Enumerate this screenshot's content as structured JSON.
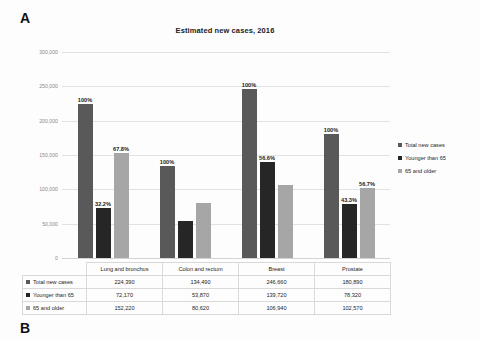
{
  "panels": {
    "a_label": "A",
    "b_label": "B"
  },
  "chart_data": {
    "type": "bar",
    "title": "Estimated new cases, 2016",
    "xlabel": "",
    "ylabel": "",
    "ylim": [
      0,
      300000
    ],
    "ytick_labels": [
      "300,000",
      "250,000",
      "200,000",
      "150,000",
      "100,000",
      "50,000",
      "0"
    ],
    "ytick_values": [
      300000,
      250000,
      200000,
      150000,
      100000,
      50000,
      0
    ],
    "grid": true,
    "legend_position": "right",
    "categories": [
      "Lung and bronchus",
      "Colon and rectum",
      "Breast",
      "Prostate"
    ],
    "series": [
      {
        "name": "Total new cases",
        "color": "#595959",
        "values": [
          224390,
          134490,
          246660,
          180890
        ],
        "display_values": [
          "224,390",
          "134,490",
          "246,660",
          "180,890"
        ],
        "point_labels": [
          "100%",
          "100%",
          "100%",
          "100%"
        ]
      },
      {
        "name": "Younger than 65",
        "color": "#262626",
        "values": [
          72170,
          53870,
          139720,
          78320
        ],
        "display_values": [
          "72,170",
          "53,870",
          "139,720",
          "78,320"
        ],
        "point_labels": [
          "32.2%",
          "",
          "56.6%",
          "43.3%"
        ]
      },
      {
        "name": "65 and older",
        "color": "#a6a6a6",
        "values": [
          152220,
          80620,
          106940,
          102570
        ],
        "display_values": [
          "152,220",
          "80,620",
          "106,940",
          "102,570"
        ],
        "point_labels": [
          "67.8%",
          "",
          "",
          "56.7%"
        ]
      }
    ]
  },
  "table": {
    "corner": "",
    "column_headers": [
      "Lung and bronchus",
      "Colon and rectum",
      "Breast",
      "Prostate"
    ],
    "rows": [
      {
        "label": "Total new cases",
        "color": "#595959",
        "cells": [
          "224,390",
          "134,490",
          "246,660",
          "180,890"
        ]
      },
      {
        "label": "Younger than 65",
        "color": "#262626",
        "cells": [
          "72,170",
          "53,870",
          "139,720",
          "78,320"
        ]
      },
      {
        "label": "65 and older",
        "color": "#a6a6a6",
        "cells": [
          "152,220",
          "80,620",
          "106,940",
          "102,570"
        ]
      }
    ]
  },
  "legend": {
    "items": [
      {
        "label": "Total new cases",
        "color": "#595959"
      },
      {
        "label": "Younger than 65",
        "color": "#262626"
      },
      {
        "label": "65 and older",
        "color": "#a6a6a6"
      }
    ]
  }
}
